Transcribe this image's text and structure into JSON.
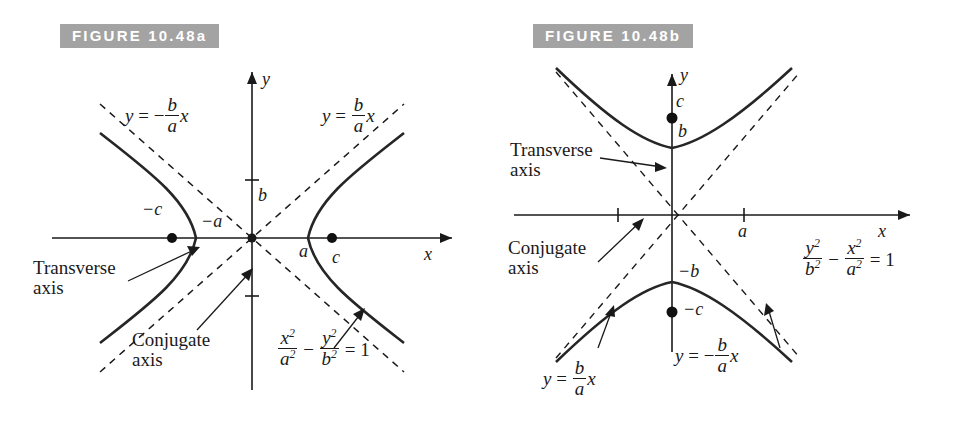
{
  "figure_a": {
    "banner": "FIGURE 10.48a",
    "axis_x_label": "x",
    "axis_y_label": "y",
    "asymptote_left_label": {
      "y": "y",
      "eq": "=",
      "sign": "−",
      "num": "b",
      "den": "a",
      "x": "x"
    },
    "asymptote_right_label": {
      "y": "y",
      "eq": "=",
      "sign": "",
      "num": "b",
      "den": "a",
      "x": "x"
    },
    "vertex_neg_a": "−a",
    "vertex_pos_a": "a",
    "focus_neg_c": "−c",
    "focus_pos_c": "c",
    "semi_axis_b": "b",
    "transverse_axis_line1": "Transverse",
    "transverse_axis_line2": "axis",
    "conjugate_axis_line1": "Conjugate",
    "conjugate_axis_line2": "axis",
    "equation": {
      "num1": "x",
      "exp1": "2",
      "den1": "a",
      "dexp1": "2",
      "op": "−",
      "num2": "y",
      "exp2": "2",
      "den2": "b",
      "dexp2": "2",
      "eq": "=",
      "rhs": "1"
    }
  },
  "figure_b": {
    "banner": "FIGURE 10.48b",
    "axis_x_label": "x",
    "axis_y_label": "y",
    "asymptote_pos_label": {
      "y": "y",
      "eq": "=",
      "sign": "",
      "num": "b",
      "den": "a",
      "x": "x"
    },
    "asymptote_neg_label": {
      "y": "y",
      "eq": "=",
      "sign": "−",
      "num": "b",
      "den": "a",
      "x": "x"
    },
    "vertex_pos_b": "b",
    "vertex_neg_b": "−b",
    "focus_pos_c": "c",
    "focus_neg_c": "−c",
    "semi_axis_a": "a",
    "transverse_axis_line1": "Transverse",
    "transverse_axis_line2": "axis",
    "conjugate_axis_line1": "Conjugate",
    "conjugate_axis_line2": "axis",
    "equation": {
      "num1": "y",
      "exp1": "2",
      "den1": "b",
      "dexp1": "2",
      "op": "−",
      "num2": "x",
      "exp2": "2",
      "den2": "a",
      "dexp2": "2",
      "eq": "=",
      "rhs": "1"
    }
  },
  "style": {
    "banner_bg": "#a3a3a3",
    "banner_fg": "#ffffff",
    "ink": "#1a1a1a",
    "curve": "#262626",
    "page_bg": "#ffffff"
  }
}
